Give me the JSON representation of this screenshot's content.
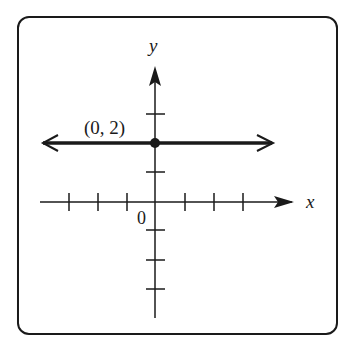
{
  "figure": {
    "axis_labels": {
      "x": "x",
      "y": "y"
    },
    "origin_label": "0",
    "point_label": "(0, 2)",
    "point": {
      "x": 0,
      "y": 2
    },
    "line": {
      "type": "horizontal",
      "equation": "y = 2"
    },
    "x_ticks": [
      -3,
      -2,
      -1,
      1,
      2,
      3
    ],
    "y_ticks": [
      -3,
      -2,
      -1,
      1,
      3
    ],
    "colors": {
      "ink": "#1a1a1a",
      "background": "#ffffff"
    }
  }
}
